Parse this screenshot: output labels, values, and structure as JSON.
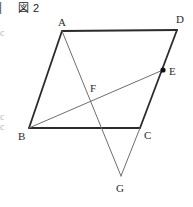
{
  "figure": {
    "caption": "図 2",
    "caption_fallback": "▨ 2",
    "background_color": "#ffffff",
    "outline_color": "#2b2b2b",
    "inner_line_color": "#6e6e6e",
    "label_color": "#2b2b2b",
    "outline_width": 1.8,
    "inner_width": 1.0,
    "width": 193,
    "height": 207
  },
  "edge_fragments": [
    {
      "text": "▏",
      "x": 0,
      "y": 2,
      "w": 5,
      "h": 14,
      "tone": "dark"
    },
    {
      "text": "c",
      "x": 0,
      "y": 28,
      "w": 5,
      "h": 12,
      "tone": "light"
    },
    {
      "text": "c",
      "x": 0,
      "y": 112,
      "w": 5,
      "h": 12,
      "tone": "light"
    },
    {
      "text": "c",
      "x": 0,
      "y": 122,
      "w": 5,
      "h": 12,
      "tone": "light"
    }
  ],
  "points": [
    {
      "id": "A",
      "label": "A",
      "x": 62,
      "y": 31,
      "label_x": 58,
      "label_y": 17,
      "marked": false
    },
    {
      "id": "D",
      "label": "D",
      "x": 177,
      "y": 30,
      "label_x": 176,
      "label_y": 14,
      "marked": false
    },
    {
      "id": "B",
      "label": "B",
      "x": 29,
      "y": 128,
      "label_x": 18,
      "label_y": 131,
      "marked": false
    },
    {
      "id": "C",
      "label": "C",
      "x": 140,
      "y": 128,
      "label_x": 144,
      "label_y": 130,
      "marked": false
    },
    {
      "id": "E",
      "label": "E",
      "x": 163,
      "y": 70,
      "label_x": 169,
      "label_y": 66,
      "marked": true
    },
    {
      "id": "F",
      "label": "F",
      "x": 92,
      "y": 97,
      "label_x": 90,
      "label_y": 83,
      "marked": false
    },
    {
      "id": "G",
      "label": "G",
      "x": 121,
      "y": 176,
      "label_x": 116,
      "label_y": 183,
      "marked": false
    }
  ],
  "segments": [
    {
      "name": "side-AD",
      "from": "A",
      "to": "D",
      "style": "outline"
    },
    {
      "name": "side-AB",
      "from": "A",
      "to": "B",
      "style": "outline"
    },
    {
      "name": "side-BC",
      "from": "B",
      "to": "C",
      "style": "outline"
    },
    {
      "name": "side-DC",
      "from": "D",
      "to": "C",
      "style": "outline"
    },
    {
      "name": "segment-AG",
      "from": "A",
      "to": "G",
      "style": "inner"
    },
    {
      "name": "segment-BE",
      "from": "B",
      "to": "E",
      "style": "inner"
    },
    {
      "name": "segment-CG",
      "from": "C",
      "to": "G",
      "style": "inner"
    }
  ],
  "point_marker": {
    "radius": 2.6,
    "fill": "#111111"
  }
}
